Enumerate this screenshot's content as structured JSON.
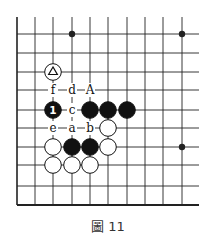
{
  "figure": {
    "caption": "圖 11"
  },
  "board": {
    "columns_x": [
      17,
      35,
      53,
      72,
      90,
      108,
      127,
      145,
      163,
      182
    ],
    "rows_y": [
      34,
      53,
      72,
      90,
      110,
      128,
      147,
      165,
      186,
      205
    ],
    "top_open_y": 17,
    "right_open_x": 199,
    "hoshi": [
      {
        "col": 3,
        "row": 0
      },
      {
        "col": 9,
        "row": 0
      },
      {
        "col": 9,
        "row": 6
      }
    ],
    "stones": [
      {
        "color": "white",
        "col": 2,
        "row": 2,
        "mark": "triangle"
      },
      {
        "color": "black",
        "col": 2,
        "row": 4,
        "number": "1"
      },
      {
        "color": "black",
        "col": 4,
        "row": 4
      },
      {
        "color": "black",
        "col": 5,
        "row": 4
      },
      {
        "color": "black",
        "col": 6,
        "row": 4
      },
      {
        "color": "white",
        "col": 5,
        "row": 5
      },
      {
        "color": "white",
        "col": 2,
        "row": 6
      },
      {
        "color": "black",
        "col": 3,
        "row": 6
      },
      {
        "color": "black",
        "col": 4,
        "row": 6
      },
      {
        "color": "white",
        "col": 5,
        "row": 6
      },
      {
        "color": "white",
        "col": 2,
        "row": 7
      },
      {
        "color": "white",
        "col": 3,
        "row": 7
      },
      {
        "color": "white",
        "col": 4,
        "row": 7
      }
    ],
    "labels": [
      {
        "text": "f",
        "col": 2,
        "row": 3
      },
      {
        "text": "d",
        "col": 3,
        "row": 3
      },
      {
        "text": "A",
        "col": 4,
        "row": 3
      },
      {
        "text": "c",
        "col": 3,
        "row": 4
      },
      {
        "text": "e",
        "col": 2,
        "row": 5
      },
      {
        "text": "a",
        "col": 3,
        "row": 5
      },
      {
        "text": "b",
        "col": 4,
        "row": 5
      }
    ],
    "colors": {
      "line": "#222222",
      "black_stone": "#111111",
      "white_stone": "#ffffff"
    }
  }
}
